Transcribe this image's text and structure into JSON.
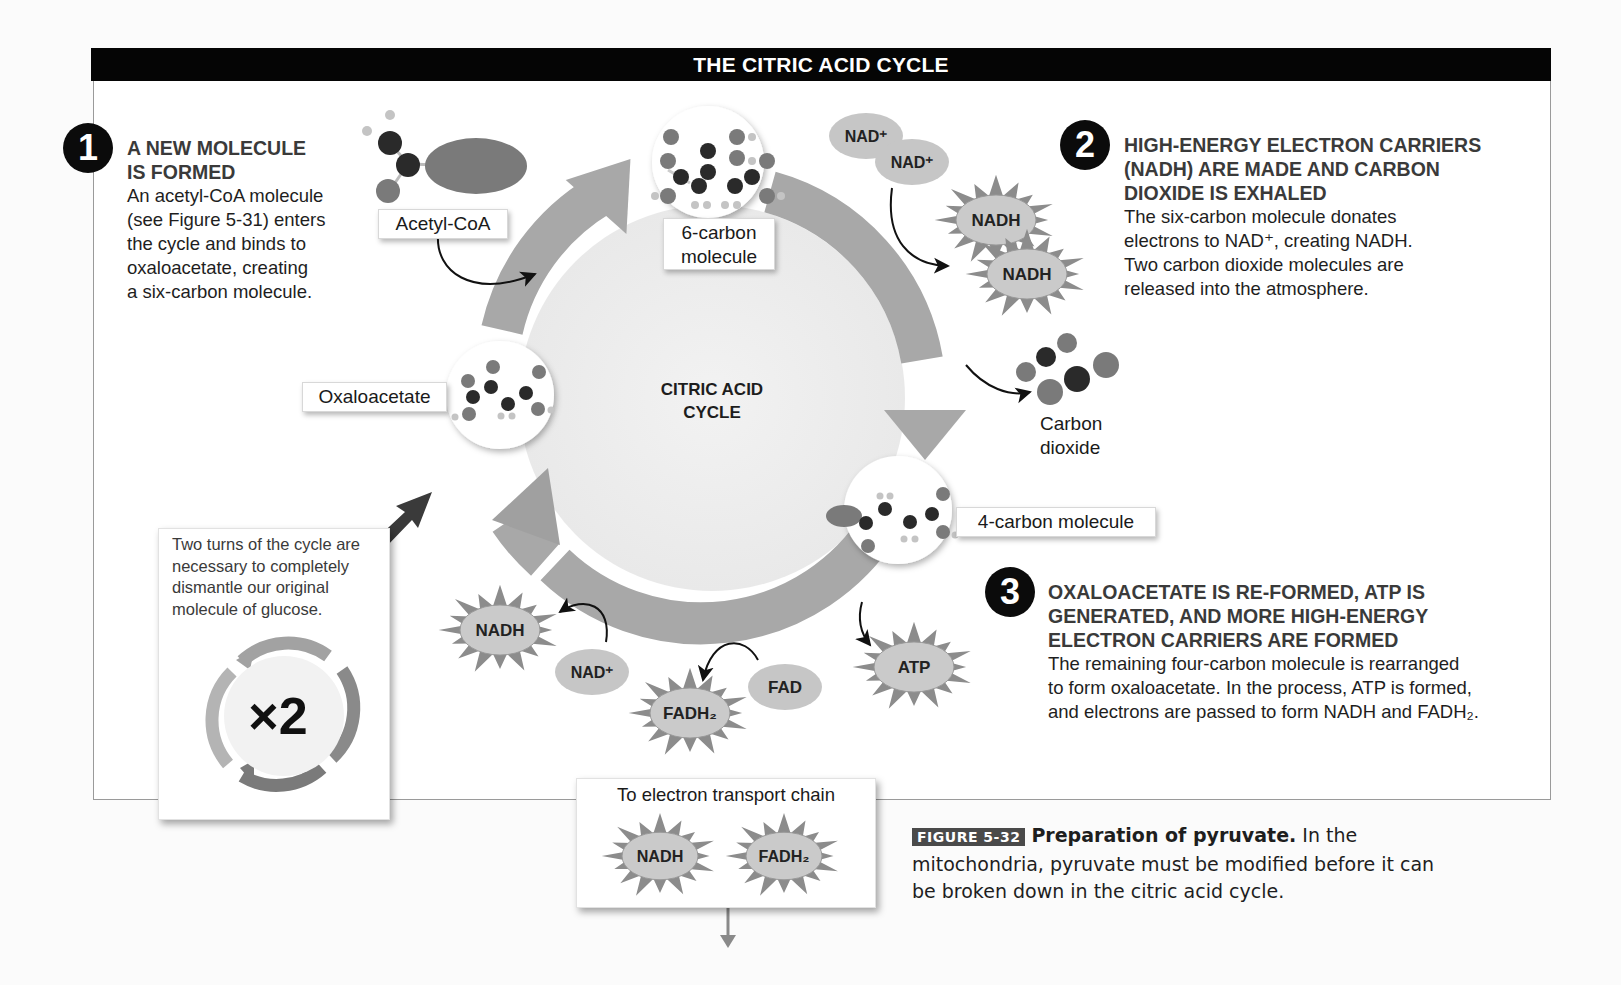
{
  "title": "THE CITRIC ACID CYCLE",
  "center_label": [
    "CITRIC ACID",
    "CYCLE"
  ],
  "steps": [
    {
      "number": "1",
      "heading": [
        "A NEW MOLECULE",
        "IS FORMED"
      ],
      "body": [
        "An acetyl-CoA molecule",
        "(see Figure 5-31) enters",
        "the cycle and binds to",
        "oxaloacetate, creating",
        "a six-carbon molecule."
      ]
    },
    {
      "number": "2",
      "heading": [
        "HIGH-ENERGY ELECTRON CARRIERS",
        "(NADH) ARE MADE AND CARBON",
        "DIOXIDE IS EXHALED"
      ],
      "body": [
        "The six-carbon molecule donates",
        "electrons to NAD⁺, creating NADH.",
        "Two carbon dioxide molecules are",
        "released into the atmosphere."
      ]
    },
    {
      "number": "3",
      "heading": [
        "OXALOACETATE IS RE-FORMED, ATP IS",
        "GENERATED, AND MORE HIGH-ENERGY",
        "ELECTRON CARRIERS ARE FORMED"
      ],
      "body": [
        "The remaining four-carbon molecule is rearranged",
        "to form oxaloacetate. In the process, ATP is formed,",
        "and electrons are passed to form NADH and FADH₂."
      ]
    }
  ],
  "molecule_labels": {
    "acetyl_coa": "Acetyl-CoA",
    "six_carbon": [
      "6-carbon",
      "molecule"
    ],
    "oxaloacetate": "Oxaloacetate",
    "four_carbon": "4-carbon molecule",
    "carbon_dioxide": [
      "Carbon",
      "dioxide"
    ]
  },
  "carriers": {
    "nad_plus": "NAD⁺",
    "nadh": "NADH",
    "fad": "FAD",
    "fadh2": "FADH₂",
    "atp": "ATP"
  },
  "note": {
    "text": [
      "Two turns of the cycle are",
      "necessary to completely",
      "dismantle our original",
      "molecule of glucose."
    ],
    "multiplier": "×2"
  },
  "etc_box": {
    "title": "To electron transport chain",
    "items": [
      "NADH",
      "FADH₂"
    ]
  },
  "caption": {
    "tag": "FIGURE 5-32",
    "bold": "Preparation of pyruvate.",
    "text_line1": " In the",
    "text_line2": "mitochondria, pyruvate must be modified before it can",
    "text_line3": "be broken down in the citric acid cycle."
  },
  "colors": {
    "title_bar": "#050505",
    "ring": "#a8a8a8",
    "starburst": "#8c8c8c",
    "chip": "#c6c6c6",
    "carbon_atom": "#2a2a2a",
    "oxygen_atom": "#7a7a7a",
    "hydrogen_atom": "#c4c4c4"
  }
}
